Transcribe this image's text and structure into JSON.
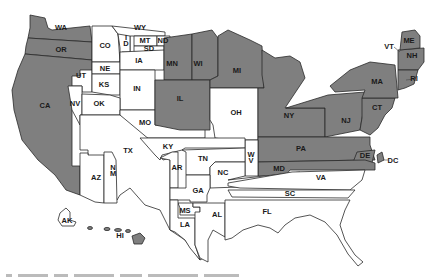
{
  "map": {
    "type": "choropleth",
    "region": "United States",
    "colors": {
      "shaded": "#7f7f7f",
      "unshaded": "#ffffff",
      "border": "#2a2a2a",
      "background": "#ffffff"
    },
    "labels": {
      "WA": "WA",
      "OR": "OR",
      "CA": "CA",
      "NV": "NV",
      "UT": "UT",
      "AZ": "AZ",
      "NM": "N M",
      "CO": "CO",
      "WY": "WY",
      "ID": "I D",
      "MT": "MT",
      "ND": "ND",
      "SD": "SD",
      "NE": "NE",
      "KS": "KS",
      "OK": "OK",
      "TX": "TX",
      "IA": "IA",
      "IN": "IN",
      "MO": "MO",
      "MN": "MN",
      "WI": "WI",
      "IL": "IL",
      "MI": "MI",
      "OH": "OH",
      "KY": "KY",
      "AR": "AR",
      "TN": "TN",
      "NC": "NC",
      "GA": "GA",
      "MS": "MS",
      "AL": "AL",
      "LA": "LA",
      "FL": "FL",
      "SC": "SC",
      "VA": "VA",
      "WV": "W V",
      "MD": "MD",
      "PA": "PA",
      "DE": "DE",
      "DC": "DC",
      "NJ": "NJ",
      "NY": "NY",
      "CT": "CT",
      "MA": "MA",
      "RI": "RI",
      "NH": "NH",
      "ME": "ME",
      "VT": "VT",
      "AK": "AK",
      "HI": "HI"
    },
    "shaded_states": [
      "WA",
      "OR",
      "CA",
      "MN",
      "WI",
      "IL",
      "MI",
      "NY",
      "NJ",
      "PA",
      "MD",
      "DE",
      "CT",
      "MA",
      "NH",
      "ME",
      "HI"
    ],
    "unshaded_states": [
      "NV",
      "UT",
      "AZ",
      "NM",
      "CO",
      "WY",
      "ID",
      "MT",
      "ND",
      "SD",
      "NE",
      "KS",
      "OK",
      "TX",
      "IA",
      "IN",
      "MO",
      "OH",
      "KY",
      "AR",
      "TN",
      "NC",
      "GA",
      "MS",
      "AL",
      "LA",
      "FL",
      "SC",
      "VA",
      "WV",
      "DC",
      "RI",
      "VT",
      "AK"
    ]
  }
}
